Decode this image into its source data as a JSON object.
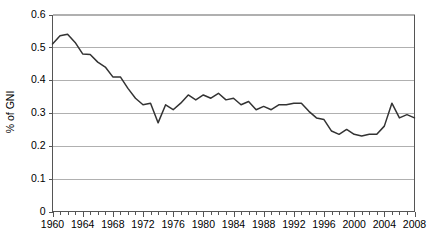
{
  "chart_data": {
    "type": "line",
    "title": "",
    "subtitle": "",
    "xlabel": "",
    "ylabel": "% of GNI",
    "xlim": [
      1960,
      2008
    ],
    "ylim": [
      0,
      0.6
    ],
    "grid": true,
    "legend": false,
    "legend_position": "none",
    "line_color": "#333333",
    "gridline_color": "#b0b0b0",
    "background_color": "#ffffff",
    "ytick_labels": [
      "0",
      "0.1",
      "0.2",
      "0.3",
      "0.4",
      "0.5",
      "0.6"
    ],
    "ytick_values": [
      0,
      0.1,
      0.2,
      0.3,
      0.4,
      0.5,
      0.6
    ],
    "xtick_labels": [
      "1960",
      "1964",
      "1968",
      "1972",
      "1976",
      "1980",
      "1984",
      "1988",
      "1992",
      "1996",
      "2000",
      "2004",
      "2008"
    ],
    "xtick_values": [
      1960,
      1964,
      1968,
      1972,
      1976,
      1980,
      1984,
      1988,
      1992,
      1996,
      2000,
      2004,
      2008
    ],
    "xminor_step": 1,
    "x": [
      1960,
      1961,
      1962,
      1963,
      1964,
      1965,
      1966,
      1967,
      1968,
      1969,
      1970,
      1971,
      1972,
      1973,
      1974,
      1975,
      1976,
      1977,
      1978,
      1979,
      1980,
      1981,
      1982,
      1983,
      1984,
      1985,
      1986,
      1987,
      1988,
      1989,
      1990,
      1991,
      1992,
      1993,
      1994,
      1995,
      1996,
      1997,
      1998,
      1999,
      2000,
      2001,
      2002,
      2003,
      2004,
      2005,
      2006,
      2007,
      2008
    ],
    "values": [
      0.51,
      0.535,
      0.54,
      0.515,
      0.48,
      0.478,
      0.455,
      0.44,
      0.41,
      0.41,
      0.375,
      0.345,
      0.325,
      0.33,
      0.27,
      0.325,
      0.31,
      0.33,
      0.355,
      0.34,
      0.355,
      0.345,
      0.36,
      0.34,
      0.345,
      0.325,
      0.335,
      0.31,
      0.32,
      0.31,
      0.325,
      0.325,
      0.33,
      0.33,
      0.305,
      0.285,
      0.28,
      0.245,
      0.235,
      0.25,
      0.235,
      0.23,
      0.235,
      0.235,
      0.26,
      0.33,
      0.285,
      0.295,
      0.285
    ],
    "series": [
      {
        "name": "Official development assistance",
        "values": [
          0.51,
          0.535,
          0.54,
          0.515,
          0.48,
          0.478,
          0.455,
          0.44,
          0.41,
          0.41,
          0.375,
          0.345,
          0.325,
          0.33,
          0.27,
          0.325,
          0.31,
          0.33,
          0.355,
          0.34,
          0.355,
          0.345,
          0.36,
          0.34,
          0.345,
          0.325,
          0.335,
          0.31,
          0.32,
          0.31,
          0.325,
          0.325,
          0.33,
          0.33,
          0.305,
          0.285,
          0.28,
          0.245,
          0.235,
          0.25,
          0.235,
          0.23,
          0.235,
          0.235,
          0.26,
          0.33,
          0.285,
          0.295,
          0.285
        ]
      }
    ]
  }
}
